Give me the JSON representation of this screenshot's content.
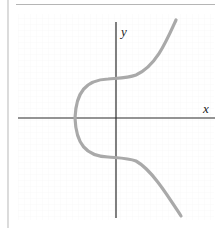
{
  "diagram": {
    "type": "elliptic-curve-plot",
    "axes": {
      "x_label": "x",
      "y_label": "y"
    },
    "curve": {
      "color": "#a9a9a9",
      "description": "Smooth curve crossing the x-axis once on the negative side and the y-axis twice"
    },
    "colors": {
      "background": "#ffffff",
      "axis": "#222222",
      "frame": "#bbbbbb",
      "grid": "#f2f2f2"
    }
  }
}
